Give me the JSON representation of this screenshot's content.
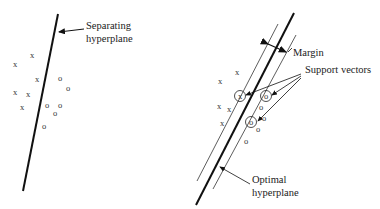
{
  "left_panel": {
    "label_line1": "Separating",
    "label_line2": "hyperplane",
    "x_points": [
      {
        "x": 32,
        "y": 55
      },
      {
        "x": 15,
        "y": 64
      },
      {
        "x": 37,
        "y": 79
      },
      {
        "x": 15,
        "y": 92
      },
      {
        "x": 28,
        "y": 94
      },
      {
        "x": 22,
        "y": 107
      }
    ],
    "o_points": [
      {
        "x": 60,
        "y": 78
      },
      {
        "x": 68,
        "y": 88
      },
      {
        "x": 47,
        "y": 105
      },
      {
        "x": 60,
        "y": 105
      },
      {
        "x": 55,
        "y": 113
      },
      {
        "x": 44,
        "y": 126
      }
    ]
  },
  "right_panel": {
    "margin_label": "Margin",
    "support_label": "Support vectors",
    "optimal_label_line1": "Optimal",
    "optimal_label_line2": "hyperplane",
    "x_points": [
      {
        "x": 237,
        "y": 72
      },
      {
        "x": 220,
        "y": 81
      },
      {
        "x": 219,
        "y": 106
      },
      {
        "x": 229,
        "y": 109
      },
      {
        "x": 222,
        "y": 123
      }
    ],
    "o_points": [
      {
        "x": 261,
        "y": 107
      },
      {
        "x": 264,
        "y": 118
      },
      {
        "x": 258,
        "y": 129
      },
      {
        "x": 246,
        "y": 141
      }
    ],
    "support_vectors": [
      {
        "glyph": "x",
        "x": 240,
        "y": 96
      },
      {
        "glyph": "o",
        "x": 266,
        "y": 96
      },
      {
        "glyph": "o",
        "x": 251,
        "y": 122
      }
    ]
  }
}
